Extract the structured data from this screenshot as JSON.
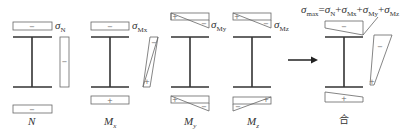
{
  "diagram": {
    "colors": {
      "line": "#555555",
      "beam": "#333333",
      "text": "#333333",
      "arrow": "#222222"
    },
    "sections": [
      {
        "id": "N",
        "case_label": "N",
        "case_sub": "",
        "sigma_label": "σ",
        "sigma_sub": "N",
        "top_sign": "−",
        "bottom_sign": "−",
        "side_sign": "−"
      },
      {
        "id": "Mx",
        "case_label": "M",
        "case_sub": "x",
        "sigma_label": "σ",
        "sigma_sub": "Mx",
        "top_sign": "−",
        "bottom_sign": "+",
        "side_top_sign": "−",
        "side_bottom_sign": "+"
      },
      {
        "id": "My",
        "case_label": "M",
        "case_sub": "y",
        "sigma_label": "σ",
        "sigma_sub": "My",
        "top_left_sign": "+",
        "top_right_sign": "−",
        "bottom_left_sign": "+",
        "bottom_right_sign": "−"
      },
      {
        "id": "Mz",
        "case_label": "M",
        "case_sub": "z",
        "sigma_label": "σ",
        "sigma_sub": "Mz",
        "top_left_sign": "+",
        "top_right_sign": "−",
        "bottom_left_sign": "−",
        "bottom_right_sign": "+"
      }
    ],
    "combined": {
      "formula_parts": [
        {
          "base": "σ",
          "sub": "max"
        },
        {
          "op": "="
        },
        {
          "base": "σ",
          "sub": "N"
        },
        {
          "op": "+"
        },
        {
          "base": "σ",
          "sub": "Mx"
        },
        {
          "op": "+"
        },
        {
          "base": "σ",
          "sub": "My"
        },
        {
          "op": "+"
        },
        {
          "base": "σ",
          "sub": "Mz"
        }
      ],
      "formula_text": "σmax=σN+σMx+σMy+σMz",
      "top_sign": "−",
      "bottom_sign": "+",
      "side_top_sign": "−",
      "side_bottom_sign": "+",
      "label": "合"
    },
    "arrow": {
      "direction": "right"
    }
  }
}
